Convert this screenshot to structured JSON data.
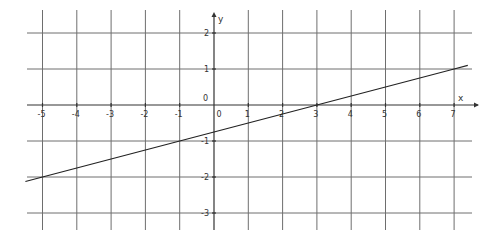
{
  "chart_data": {
    "type": "line",
    "title": "",
    "xlabel": "x",
    "ylabel": "y",
    "xlim": [
      -5.5,
      7.5
    ],
    "ylim": [
      -3.5,
      2.7
    ],
    "grid": true,
    "x_ticks": [
      -5,
      -4,
      -3,
      -2,
      -1,
      0,
      1,
      2,
      3,
      4,
      5,
      6,
      7
    ],
    "y_ticks": [
      -3,
      -2,
      -1,
      0,
      1,
      2
    ],
    "x_tick_labels": [
      "-5",
      "-4",
      "-3",
      "-2",
      "-1",
      "0",
      "1",
      "2",
      "3",
      "4",
      "5",
      "6",
      "7"
    ],
    "y_tick_labels": [
      "-3",
      "-2",
      "-1",
      "0",
      "1",
      "2"
    ],
    "origin_labels": {
      "x": "0",
      "y": "0"
    },
    "series": [
      {
        "name": "line",
        "equation": "y = 0.25x - 0.75",
        "slope": 0.25,
        "intercept": -0.75,
        "x": [
          -5.5,
          -5,
          -1,
          3,
          7,
          7.4
        ],
        "y": [
          -2.125,
          -2,
          -1,
          0,
          1,
          1.1
        ]
      }
    ],
    "key_points": [
      {
        "x": -5,
        "y": -2
      },
      {
        "x": -1,
        "y": -1
      },
      {
        "x": 3,
        "y": 0
      },
      {
        "x": 7,
        "y": 1
      }
    ]
  },
  "layout": {
    "origin_px": [
      214,
      105
    ],
    "x_unit_px": 34.3,
    "y_unit_px": 36,
    "grid_left_px": 27,
    "grid_right_px": 472,
    "grid_top_px": 10,
    "grid_bottom_px": 230
  }
}
